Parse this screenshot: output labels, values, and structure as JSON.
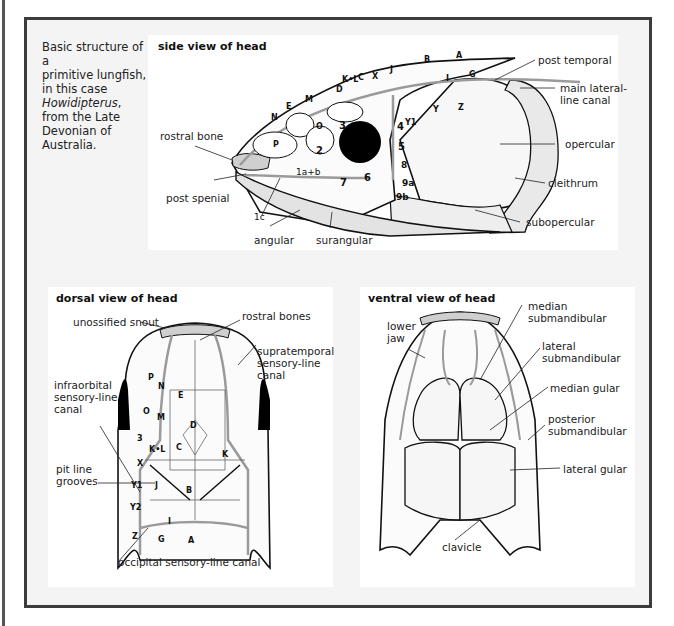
{
  "caption": {
    "line1": "Basic structure of a",
    "line2": "primitive lungfish,",
    "line3": "in this case",
    "genus": "Howidipterus",
    "line4": "from the Late",
    "line5": "Devonian of",
    "line6": "Australia."
  },
  "side_view": {
    "title": "side view of head",
    "labels": {
      "rostral_bone": "rostral bone",
      "post_spenial": "post spenial",
      "angular": "angular",
      "surangular": "surangular",
      "post_temporal": "post temporal",
      "main_lateral_line_canal_1": "main lateral-",
      "main_lateral_line_canal_2": "line canal",
      "opercular": "opercular",
      "cleithrum": "cleithrum",
      "subopercular": "subopercular"
    },
    "bones": {
      "N": "N",
      "E": "E",
      "M": "M",
      "D": "D",
      "KL": "K•L",
      "C": "C",
      "X": "X",
      "J": "J",
      "B": "B",
      "A": "A",
      "G": "G",
      "I": "I",
      "Y": "Y",
      "Z": "Z",
      "Y1": "Y1",
      "O": "O",
      "P": "P",
      "n1ab": "1a+b",
      "n1c": "1c",
      "n2": "2",
      "n3": "3",
      "n4": "4",
      "n5": "5",
      "n6": "6",
      "n7": "7",
      "n8": "8",
      "n9a": "9a",
      "n9b": "9b"
    }
  },
  "dorsal_view": {
    "title": "dorsal view of head",
    "labels": {
      "unossified_snout": "unossified snout",
      "rostral_bones": "rostral bones",
      "supratemporal_1": "supratemporal",
      "supratemporal_2": "sensory-line",
      "supratemporal_3": "canal",
      "infraorbital_1": "infraorbital",
      "infraorbital_2": "sensory-line",
      "infraorbital_3": "canal",
      "pit_line_1": "pit line",
      "pit_line_2": "grooves",
      "occipital": "occipital sensory-line canal"
    },
    "bones": {
      "P": "P",
      "N": "N",
      "E": "E",
      "O": "O",
      "M": "M",
      "D": "D",
      "n3": "3",
      "KL": "K•L",
      "C": "C",
      "K": "K",
      "X": "X",
      "Y1": "Y1",
      "J": "J",
      "B": "B",
      "Y2": "Y2",
      "I": "I",
      "Z": "Z",
      "G": "G",
      "A": "A"
    }
  },
  "ventral_view": {
    "title": "ventral view of head",
    "labels": {
      "lower_jaw_1": "lower",
      "lower_jaw_2": "jaw",
      "median_submandibular_1": "median",
      "median_submandibular_2": "submandibular",
      "lateral_submandibular_1": "lateral",
      "lateral_submandibular_2": "submandibular",
      "median_gular": "median gular",
      "posterior_submandibular_1": "posterior",
      "posterior_submandibular_2": "submandibular",
      "lateral_gular": "lateral gular",
      "clavicle": "clavicle"
    }
  },
  "colors": {
    "frame": "#3c3c3c",
    "background": "#f4f4f4",
    "panel": "#ffffff",
    "ink": "#1a1a1a",
    "canal": "#9a9a9a",
    "stipple": "#d8d8d8"
  }
}
